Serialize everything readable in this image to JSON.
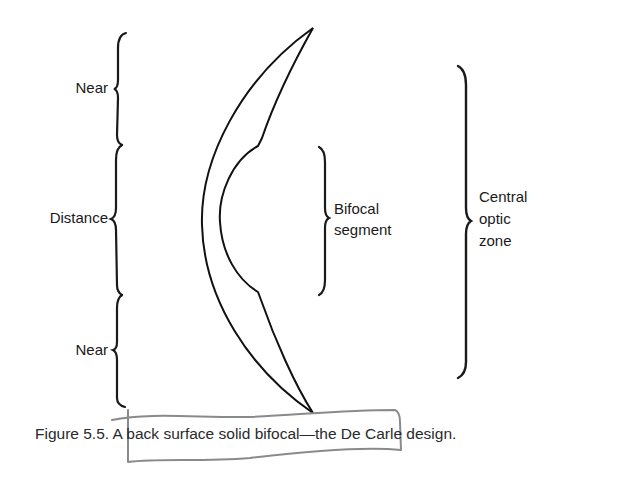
{
  "figure": {
    "labels": {
      "near_top": "Near",
      "distance": "Distance",
      "near_bottom": "Near",
      "bifocal_segment_line1": "Bifocal",
      "bifocal_segment_line2": "segment",
      "central_optic_zone_line1": "Central",
      "central_optic_zone_line2": "optic",
      "central_optic_zone_line3": "zone"
    },
    "caption": "Figure 5.5. A back surface solid bifocal—the De Carle design.",
    "colors": {
      "ink": "#1a1a1a",
      "annotation": "#8a8a8a"
    }
  }
}
